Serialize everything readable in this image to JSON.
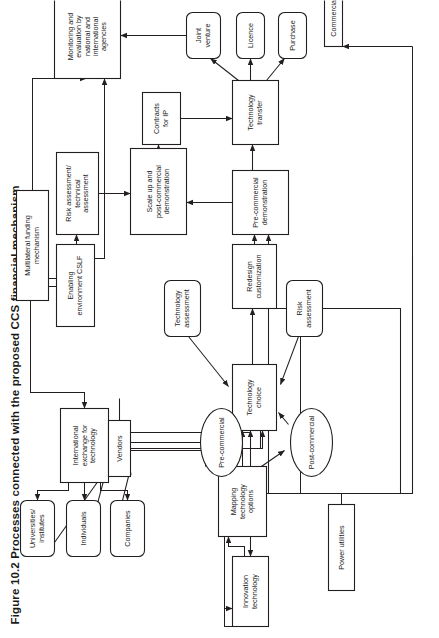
{
  "figure": {
    "number": "Figure 10.2",
    "caption": "Figure 10.2  Processes connected with the proposed CCS financial mechanism",
    "orientation": "rotated-90-ccw",
    "page_background": "#ffffff",
    "stroke_color": "#231f20"
  },
  "chart_data": {
    "type": "diagram",
    "title": "Processes connected with the proposed CCS financial mechanism",
    "nodes": [
      {
        "id": "power_utilities",
        "label": "Power utilities",
        "shape": "rect",
        "x": 48,
        "y": 328,
        "w": 86,
        "h": 26
      },
      {
        "id": "innovation",
        "label": "Innovation technology",
        "shape": "rect",
        "x": 12,
        "y": 232,
        "w": 70,
        "h": 36
      },
      {
        "id": "mapping",
        "label": "Mapping technology options",
        "shape": "rect",
        "x": 102,
        "y": 218,
        "w": 70,
        "h": 48
      },
      {
        "id": "tech_choice",
        "label": "Technology choice",
        "shape": "rect",
        "x": 208,
        "y": 232,
        "w": 66,
        "h": 44
      },
      {
        "id": "pre_commercial",
        "label": "Pre-commercial",
        "shape": "ellipse",
        "x": 162,
        "y": 200,
        "w": 68,
        "h": 42
      },
      {
        "id": "post_commercial",
        "label": "Post-commercial",
        "shape": "ellipse",
        "x": 162,
        "y": 290,
        "w": 68,
        "h": 42
      },
      {
        "id": "tech_assessment",
        "label": "Technology assessment",
        "shape": "round",
        "x": 302,
        "y": 164,
        "w": 56,
        "h": 36
      },
      {
        "id": "risk_assessment",
        "label": "Risk assessment",
        "shape": "round",
        "x": 302,
        "y": 286,
        "w": 56,
        "h": 36
      },
      {
        "id": "redesign",
        "label": "Redesign customization",
        "shape": "rect",
        "x": 330,
        "y": 232,
        "w": 64,
        "h": 44
      },
      {
        "id": "pre_comm_demo",
        "label": "Pre-commercial demonstration",
        "shape": "rect",
        "x": 404,
        "y": 232,
        "w": 64,
        "h": 56
      },
      {
        "id": "scale_up",
        "label": "Scale up and post-commercial demonstration",
        "shape": "rect",
        "x": 404,
        "y": 130,
        "w": 86,
        "h": 56
      },
      {
        "id": "tech_transfer",
        "label": "Technology transfer",
        "shape": "rect",
        "x": 494,
        "y": 232,
        "w": 64,
        "h": 46
      },
      {
        "id": "contracts_ip",
        "label": "Contracts for IP",
        "shape": "rect",
        "x": 494,
        "y": 142,
        "w": 52,
        "h": 38
      },
      {
        "id": "purchase",
        "label": "Purchase",
        "shape": "round",
        "x": 580,
        "y": 278,
        "w": 46,
        "h": 28
      },
      {
        "id": "licence",
        "label": "Licence",
        "shape": "round",
        "x": 580,
        "y": 236,
        "w": 46,
        "h": 28
      },
      {
        "id": "joint_venture",
        "label": "Joint venture",
        "shape": "round",
        "x": 580,
        "y": 186,
        "w": 46,
        "h": 34
      },
      {
        "id": "commercial",
        "label": "Commercial",
        "shape": "rect",
        "x": 592,
        "y": 324,
        "w": 58,
        "h": 18
      },
      {
        "id": "monitoring",
        "label": "Monitoring and evaluation by national and international agencies",
        "shape": "rect",
        "x": 560,
        "y": 54,
        "w": 84,
        "h": 66
      },
      {
        "id": "risk_tech_assess",
        "label": "Risk assessment/ technical assessment",
        "shape": "rect",
        "x": 404,
        "y": 56,
        "w": 82,
        "h": 42
      },
      {
        "id": "enabling_env",
        "label": "Enabling environment CSLF",
        "shape": "rect",
        "x": 312,
        "y": 56,
        "w": 82,
        "h": 38
      },
      {
        "id": "multilateral",
        "label": "Multilateral funding mechanism",
        "shape": "rect",
        "x": 338,
        "y": 16,
        "w": 110,
        "h": 32
      },
      {
        "id": "intl_exchange",
        "label": "International exchange for technology",
        "shape": "rect",
        "x": 156,
        "y": 60,
        "w": 74,
        "h": 48
      },
      {
        "id": "companies",
        "label": "Companies",
        "shape": "round",
        "x": 82,
        "y": 110,
        "w": 56,
        "h": 34
      },
      {
        "id": "individuals",
        "label": "Individuals",
        "shape": "round",
        "x": 82,
        "y": 66,
        "w": 56,
        "h": 34
      },
      {
        "id": "universities",
        "label": "Universities/ institutes",
        "shape": "round",
        "x": 82,
        "y": 20,
        "w": 56,
        "h": 34
      },
      {
        "id": "vendors",
        "label": "Vendors",
        "shape": "rect",
        "x": 162,
        "y": 108,
        "w": 56,
        "h": 22
      }
    ],
    "edges": [
      {
        "from": "power_utilities",
        "to": "tech_choice"
      },
      {
        "from": "power_utilities",
        "to": "redesign"
      },
      {
        "from": "power_utilities",
        "to": "pre_comm_demo"
      },
      {
        "from": "power_utilities",
        "to": "commercial"
      },
      {
        "from": "power_utilities",
        "to": "mapping"
      },
      {
        "from": "power_utilities",
        "to": "innovation"
      },
      {
        "from": "innovation",
        "to": "mapping"
      },
      {
        "from": "mapping",
        "to": "tech_choice"
      },
      {
        "from": "mapping",
        "to": "pre_commercial"
      },
      {
        "from": "mapping",
        "to": "post_commercial"
      },
      {
        "from": "pre_commercial",
        "to": "tech_choice"
      },
      {
        "from": "post_commercial",
        "to": "tech_choice"
      },
      {
        "from": "tech_assessment",
        "to": "tech_choice"
      },
      {
        "from": "risk_assessment",
        "to": "tech_choice"
      },
      {
        "from": "tech_choice",
        "to": "redesign"
      },
      {
        "from": "redesign",
        "to": "pre_comm_demo"
      },
      {
        "from": "pre_comm_demo",
        "to": "scale_up"
      },
      {
        "from": "pre_comm_demo",
        "to": "tech_transfer"
      },
      {
        "from": "scale_up",
        "to": "contracts_ip"
      },
      {
        "from": "contracts_ip",
        "to": "tech_transfer"
      },
      {
        "from": "tech_transfer",
        "to": "purchase"
      },
      {
        "from": "tech_transfer",
        "to": "licence"
      },
      {
        "from": "tech_transfer",
        "to": "joint_venture"
      },
      {
        "from": "joint_venture",
        "to": "monitoring"
      },
      {
        "from": "risk_tech_assess",
        "to": "scale_up"
      },
      {
        "from": "enabling_env",
        "to": "risk_tech_assess"
      },
      {
        "from": "enabling_env",
        "to": "monitoring"
      },
      {
        "from": "multilateral",
        "to": "enabling_env"
      },
      {
        "from": "multilateral",
        "to": "monitoring"
      },
      {
        "from": "intl_exchange",
        "to": "companies"
      },
      {
        "from": "intl_exchange",
        "to": "individuals"
      },
      {
        "from": "intl_exchange",
        "to": "universities"
      },
      {
        "from": "intl_exchange",
        "to": "mapping"
      },
      {
        "from": "intl_exchange",
        "to": "innovation"
      },
      {
        "from": "multilateral",
        "to": "intl_exchange"
      },
      {
        "from": "companies",
        "to": "vendors"
      },
      {
        "from": "individuals",
        "to": "vendors"
      },
      {
        "from": "universities",
        "to": "vendors"
      },
      {
        "from": "vendors",
        "to": "tech_choice"
      },
      {
        "from": "vendors",
        "to": "post_commercial"
      }
    ]
  }
}
